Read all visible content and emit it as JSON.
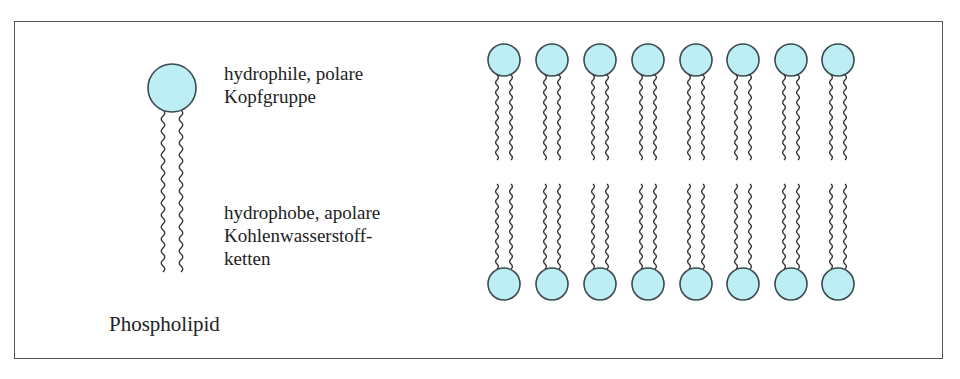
{
  "labels": {
    "head": [
      "hydrophile, polare",
      "Kopfgruppe"
    ],
    "tails": [
      "hydrophobe, apolare",
      "Kohlenwasserstoff-",
      "ketten"
    ],
    "caption": "Phospholipid"
  },
  "colors": {
    "head_fill": "#bdeef5",
    "stroke": "#3a4a4f",
    "tail": "#333333",
    "border": "#555555"
  },
  "bilayer": {
    "count": 8,
    "x_centers": [
      504,
      552,
      600,
      648,
      696,
      743,
      791,
      838
    ],
    "top_row_y": 60,
    "bottom_row_y": 284,
    "head_radius": 16
  },
  "single_lipid": {
    "cx": 172,
    "cy": 88,
    "r": 24
  }
}
